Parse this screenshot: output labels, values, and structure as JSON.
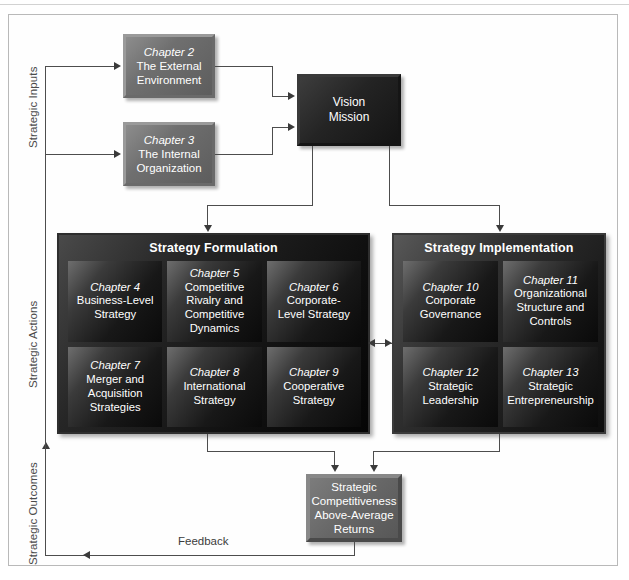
{
  "diagram": {
    "axis_labels": {
      "inputs": "Strategic Inputs",
      "actions": "Strategic Actions",
      "outcomes": "Strategic Outcomes"
    },
    "feedback_label": "Feedback"
  },
  "inputs": {
    "chapter2": {
      "chapter": "Chapter 2",
      "line1": "The External",
      "line2": "Environment"
    },
    "chapter3": {
      "chapter": "Chapter 3",
      "line1": "The Internal",
      "line2": "Organization"
    }
  },
  "vision": {
    "line1": "Vision",
    "line2": "Mission"
  },
  "formulation": {
    "title": "Strategy Formulation",
    "cells": [
      {
        "chapter": "Chapter 4",
        "lines": [
          "Business-Level",
          "Strategy"
        ]
      },
      {
        "chapter": "Chapter 5",
        "lines": [
          "Competitive",
          "Rivalry and",
          "Competitive",
          "Dynamics"
        ]
      },
      {
        "chapter": "Chapter 6",
        "lines": [
          "Corporate-",
          "Level Strategy"
        ]
      },
      {
        "chapter": "Chapter 7",
        "lines": [
          "Merger and",
          "Acquisition",
          "Strategies"
        ]
      },
      {
        "chapter": "Chapter 8",
        "lines": [
          "International",
          "Strategy"
        ]
      },
      {
        "chapter": "Chapter 9",
        "lines": [
          "Cooperative",
          "Strategy"
        ]
      }
    ]
  },
  "implementation": {
    "title": "Strategy Implementation",
    "cells": [
      {
        "chapter": "Chapter 10",
        "lines": [
          "Corporate",
          "Governance"
        ]
      },
      {
        "chapter": "Chapter 11",
        "lines": [
          "Organizational",
          "Structure and",
          "Controls"
        ]
      },
      {
        "chapter": "Chapter 12",
        "lines": [
          "Strategic",
          "Leadership"
        ]
      },
      {
        "chapter": "Chapter 13",
        "lines": [
          "Strategic",
          "Entrepreneurship"
        ]
      }
    ]
  },
  "outcome": {
    "lines": [
      "Strategic",
      "Competitiveness",
      "Above-Average",
      "Returns"
    ]
  },
  "colors": {
    "line": "#4d4d4d",
    "arrow": "#3a3a3a",
    "frame": "#b9b9b9",
    "panel_dark": "#101010",
    "box_gray": "#6f6f6f",
    "vision_dark": "#1b1b1b",
    "outcome_gray": "#676767",
    "text_light": "#ffffff",
    "text_dark": "#4b4b4b"
  }
}
